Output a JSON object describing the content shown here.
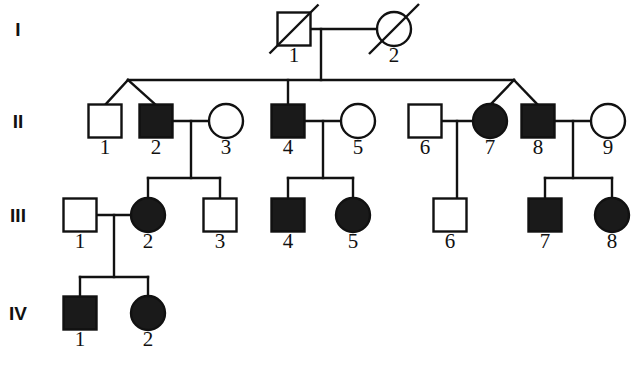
{
  "colors": {
    "affected_fill": "#1a1a1a",
    "unaffected_fill": "#ffffff",
    "line": "#111111",
    "background": "#ffffff"
  },
  "generations": [
    {
      "label": "I",
      "x": 18,
      "y": 36
    },
    {
      "label": "II",
      "x": 18,
      "y": 128
    },
    {
      "label": "III",
      "x": 18,
      "y": 222
    },
    {
      "label": "IV",
      "x": 18,
      "y": 320
    }
  ],
  "individuals": [
    {
      "id": "I-1",
      "number": "1",
      "sex": "male",
      "affected": false,
      "deceased": true,
      "cx": 294,
      "cy": 29,
      "label_x": 294,
      "label_y": 62
    },
    {
      "id": "I-2",
      "number": "2",
      "sex": "female",
      "affected": false,
      "deceased": true,
      "cx": 394,
      "cy": 29,
      "label_x": 394,
      "label_y": 62
    },
    {
      "id": "II-1",
      "number": "1",
      "sex": "male",
      "affected": false,
      "deceased": false,
      "cx": 105,
      "cy": 121,
      "label_x": 105,
      "label_y": 154
    },
    {
      "id": "II-2",
      "number": "2",
      "sex": "male",
      "affected": true,
      "deceased": false,
      "cx": 156,
      "cy": 121,
      "label_x": 156,
      "label_y": 154
    },
    {
      "id": "II-3",
      "number": "3",
      "sex": "female",
      "affected": false,
      "deceased": false,
      "cx": 226,
      "cy": 121,
      "label_x": 226,
      "label_y": 154
    },
    {
      "id": "II-4",
      "number": "4",
      "sex": "male",
      "affected": true,
      "deceased": false,
      "cx": 288,
      "cy": 121,
      "label_x": 288,
      "label_y": 154
    },
    {
      "id": "II-5",
      "number": "5",
      "sex": "female",
      "affected": false,
      "deceased": false,
      "cx": 358,
      "cy": 121,
      "label_x": 358,
      "label_y": 154
    },
    {
      "id": "II-6",
      "number": "6",
      "sex": "male",
      "affected": false,
      "deceased": false,
      "cx": 425,
      "cy": 121,
      "label_x": 425,
      "label_y": 154
    },
    {
      "id": "II-7",
      "number": "7",
      "sex": "female",
      "affected": true,
      "deceased": false,
      "cx": 490,
      "cy": 121,
      "label_x": 490,
      "label_y": 154
    },
    {
      "id": "II-8",
      "number": "8",
      "sex": "male",
      "affected": true,
      "deceased": false,
      "cx": 538,
      "cy": 121,
      "label_x": 538,
      "label_y": 154
    },
    {
      "id": "II-9",
      "number": "9",
      "sex": "female",
      "affected": false,
      "deceased": false,
      "cx": 608,
      "cy": 121,
      "label_x": 608,
      "label_y": 154
    },
    {
      "id": "III-1",
      "number": "1",
      "sex": "male",
      "affected": false,
      "deceased": false,
      "cx": 80,
      "cy": 215,
      "label_x": 80,
      "label_y": 248
    },
    {
      "id": "III-2",
      "number": "2",
      "sex": "female",
      "affected": true,
      "deceased": false,
      "cx": 148,
      "cy": 215,
      "label_x": 148,
      "label_y": 248
    },
    {
      "id": "III-3",
      "number": "3",
      "sex": "male",
      "affected": false,
      "deceased": false,
      "cx": 220,
      "cy": 215,
      "label_x": 220,
      "label_y": 248
    },
    {
      "id": "III-4",
      "number": "4",
      "sex": "male",
      "affected": true,
      "deceased": false,
      "cx": 288,
      "cy": 215,
      "label_x": 288,
      "label_y": 248
    },
    {
      "id": "III-5",
      "number": "5",
      "sex": "female",
      "affected": true,
      "deceased": false,
      "cx": 353,
      "cy": 215,
      "label_x": 353,
      "label_y": 248
    },
    {
      "id": "III-6",
      "number": "6",
      "sex": "male",
      "affected": false,
      "deceased": false,
      "cx": 450,
      "cy": 215,
      "label_x": 450,
      "label_y": 248
    },
    {
      "id": "III-7",
      "number": "7",
      "sex": "male",
      "affected": true,
      "deceased": false,
      "cx": 545,
      "cy": 215,
      "label_x": 545,
      "label_y": 248
    },
    {
      "id": "III-8",
      "number": "8",
      "sex": "female",
      "affected": true,
      "deceased": false,
      "cx": 612,
      "cy": 215,
      "label_x": 612,
      "label_y": 248
    },
    {
      "id": "IV-1",
      "number": "1",
      "sex": "male",
      "affected": true,
      "deceased": false,
      "cx": 80,
      "cy": 313,
      "label_x": 80,
      "label_y": 346
    },
    {
      "id": "IV-2",
      "number": "2",
      "sex": "female",
      "affected": true,
      "deceased": false,
      "cx": 148,
      "cy": 313,
      "label_x": 148,
      "label_y": 346
    }
  ],
  "geometry": {
    "square_size": 33,
    "circle_radius": 17
  },
  "connections": {
    "mating_lines": [
      {
        "name": "mating-I1-I2",
        "x1": 311,
        "y1": 29,
        "x2": 377,
        "y2": 29
      },
      {
        "name": "mating-II2-II3",
        "x1": 173,
        "y1": 121,
        "x2": 209,
        "y2": 121
      },
      {
        "name": "mating-II4-II5",
        "x1": 305,
        "y1": 121,
        "x2": 341,
        "y2": 121
      },
      {
        "name": "mating-II6-II7",
        "x1": 442,
        "y1": 121,
        "x2": 473,
        "y2": 121
      },
      {
        "name": "mating-II8-II9",
        "x1": 555,
        "y1": 121,
        "x2": 591,
        "y2": 121
      },
      {
        "name": "mating-III1-III2",
        "x1": 97,
        "y1": 215,
        "x2": 131,
        "y2": 215
      }
    ],
    "descent_lines": [
      {
        "name": "descent-I-sibship",
        "x1": 321,
        "y1": 29,
        "x2": 321,
        "y2": 80
      },
      {
        "name": "descent-II2-II3",
        "x1": 191,
        "y1": 121,
        "x2": 191,
        "y2": 178
      },
      {
        "name": "descent-II4-II5",
        "x1": 323,
        "y1": 121,
        "x2": 323,
        "y2": 178
      },
      {
        "name": "descent-II6-II7",
        "x1": 457,
        "y1": 121,
        "x2": 457,
        "y2": 198
      },
      {
        "name": "descent-II8-II9",
        "x1": 573,
        "y1": 121,
        "x2": 573,
        "y2": 178
      },
      {
        "name": "descent-III1-III2",
        "x1": 114,
        "y1": 215,
        "x2": 114,
        "y2": 277
      }
    ],
    "sibship_lines": [
      {
        "name": "sibship-generation-II",
        "x1": 128,
        "y1": 80,
        "x2": 514,
        "y2": 80
      },
      {
        "name": "sibship-II2-children",
        "x1": 148,
        "y1": 178,
        "x2": 220,
        "y2": 178
      },
      {
        "name": "sibship-II4-children",
        "x1": 288,
        "y1": 178,
        "x2": 353,
        "y2": 178
      },
      {
        "name": "sibship-II8-children",
        "x1": 545,
        "y1": 178,
        "x2": 612,
        "y2": 178
      },
      {
        "name": "sibship-III-children",
        "x1": 80,
        "y1": 277,
        "x2": 148,
        "y2": 277
      }
    ],
    "drop_lines": [
      {
        "name": "drop-II4",
        "x1": 288,
        "y1": 80,
        "x2": 288,
        "y2": 105
      },
      {
        "name": "drop-III2",
        "x1": 148,
        "y1": 178,
        "x2": 148,
        "y2": 198
      },
      {
        "name": "drop-III3",
        "x1": 220,
        "y1": 178,
        "x2": 220,
        "y2": 199
      },
      {
        "name": "drop-III4",
        "x1": 288,
        "y1": 178,
        "x2": 288,
        "y2": 199
      },
      {
        "name": "drop-III5",
        "x1": 353,
        "y1": 178,
        "x2": 353,
        "y2": 198
      },
      {
        "name": "drop-III7",
        "x1": 545,
        "y1": 178,
        "x2": 545,
        "y2": 199
      },
      {
        "name": "drop-III8",
        "x1": 612,
        "y1": 178,
        "x2": 612,
        "y2": 198
      },
      {
        "name": "drop-IV1",
        "x1": 80,
        "y1": 277,
        "x2": 80,
        "y2": 297
      },
      {
        "name": "drop-IV2",
        "x1": 148,
        "y1": 277,
        "x2": 148,
        "y2": 296
      }
    ],
    "diagonal_lines": [
      {
        "name": "diagonal-to-II1",
        "x1": 128,
        "y1": 80,
        "x2": 105,
        "y2": 105
      },
      {
        "name": "diagonal-to-II2",
        "x1": 128,
        "y1": 80,
        "x2": 156,
        "y2": 105
      },
      {
        "name": "diagonal-to-II7",
        "x1": 514,
        "y1": 80,
        "x2": 490,
        "y2": 105
      },
      {
        "name": "diagonal-to-II8",
        "x1": 514,
        "y1": 80,
        "x2": 538,
        "y2": 105
      }
    ]
  }
}
